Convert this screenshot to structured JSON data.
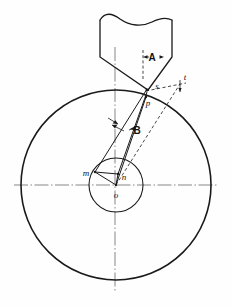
{
  "figure": {
    "kind": "engineering-diagram",
    "background_color": "#fefefe",
    "ink_color": "#1a1a1a",
    "canvas": {
      "width": 232,
      "height": 307
    }
  },
  "geometry": {
    "large_circle": {
      "cx": 116,
      "cy": 185,
      "r": 95,
      "label": "workpiece-outer-circle"
    },
    "small_circle": {
      "cx": 116,
      "cy": 185,
      "r": 27,
      "label": "workpiece-inner-circle"
    },
    "center_point": {
      "x": 116,
      "y": 185
    },
    "horizontal_centerline": {
      "x1": 14,
      "y1": 185,
      "x2": 219,
      "y2": 185
    },
    "vertical_centerline": {
      "x": 115,
      "y1": 47,
      "y2": 292
    }
  },
  "tool": {
    "name": "cutting-tool-outline",
    "break_line_note": "wavy break line at top of tool body",
    "outline_points": "100,20 100,57 148,90 172,57 172,20",
    "tip_point": {
      "x": 148,
      "y": 90
    }
  },
  "labels": [
    {
      "id": "A",
      "text": "A",
      "x": 152,
      "y": 59,
      "style": "cap",
      "name": "angle-label-a"
    },
    {
      "id": "B",
      "text": "B",
      "x": 137,
      "y": 131,
      "style": "cap",
      "name": "angle-label-b"
    },
    {
      "id": "s",
      "text": "s",
      "x": 157,
      "y": 88,
      "style": "italic",
      "name": "point-label-s"
    },
    {
      "id": "t",
      "text": "t",
      "x": 183,
      "y": 86,
      "style": "italic",
      "name": "point-label-t"
    },
    {
      "id": "p",
      "text": "p",
      "x": 148,
      "y": 104,
      "style": "italic",
      "name": "point-label-p"
    },
    {
      "id": "m",
      "text": "m",
      "x": 86,
      "y": 177,
      "style": "italic",
      "name": "point-label-m"
    },
    {
      "id": "n",
      "text": "n",
      "x": 122,
      "y": 180,
      "style": "italic",
      "name": "point-label-n"
    },
    {
      "id": "o",
      "text": "o",
      "x": 115,
      "y": 197,
      "style": "italic",
      "name": "point-label-o"
    }
  ],
  "points": {
    "s": {
      "x": 148,
      "y": 90
    },
    "t": {
      "x": 180,
      "y": 83
    },
    "p": {
      "x": 146,
      "y": 97
    },
    "m": {
      "x": 95,
      "y": 172
    },
    "n": {
      "x": 118,
      "y": 174
    },
    "o": {
      "x": 116,
      "y": 185
    }
  },
  "construction_lines": [
    {
      "name": "line-m-to-s",
      "from": "m",
      "to": "s"
    },
    {
      "name": "line-o-to-p",
      "from": "o",
      "to": "p"
    },
    {
      "name": "line-n-to-p",
      "from": "n",
      "to": "p"
    },
    {
      "name": "line-m-to-n",
      "from": "m",
      "to": "n"
    },
    {
      "name": "line-m-to-o",
      "from": "m",
      "to": "o"
    },
    {
      "name": "line-n-to-o",
      "from": "n",
      "to": "o"
    },
    {
      "name": "dashed-line-o-to-t",
      "from": "o",
      "to": "t",
      "dashed": true
    },
    {
      "name": "dashed-tangent-s-to-t",
      "from": "s",
      "to": "t",
      "dashed": true
    }
  ]
}
